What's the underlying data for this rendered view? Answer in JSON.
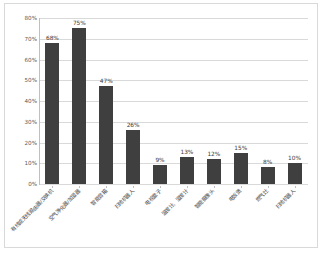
{
  "chart_data": {
    "type": "bar",
    "title": "",
    "xlabel": "",
    "ylabel": "",
    "categories": [
      "有线或无线路由器/交换机",
      "空气净化器/加湿器",
      "智能音箱",
      "扫地机器人",
      "电视盒子",
      "温度计、湿度计",
      "智能摄像头",
      "电饭煲",
      "燃气灶",
      "扫地机器人"
    ],
    "values": [
      68,
      75,
      47,
      26,
      9,
      13,
      12,
      15,
      8,
      10
    ],
    "value_labels": [
      "68%",
      "75%",
      "47%",
      "26%",
      "9%",
      "13%",
      "12%",
      "15%",
      "8%",
      "10%"
    ],
    "ytick_labels": [
      "0%",
      "10%",
      "20%",
      "30%",
      "40%",
      "50%",
      "60%",
      "70%",
      "80%"
    ],
    "ytick_values": [
      0,
      10,
      20,
      30,
      40,
      50,
      60,
      70,
      80
    ],
    "ylim": [
      0,
      80
    ],
    "grid": true,
    "legend": false,
    "bar_color": "#3f3f3f",
    "grid_color": "#d9d9d9",
    "axis_color": "#bfbfbf",
    "background": "#ffffff"
  }
}
